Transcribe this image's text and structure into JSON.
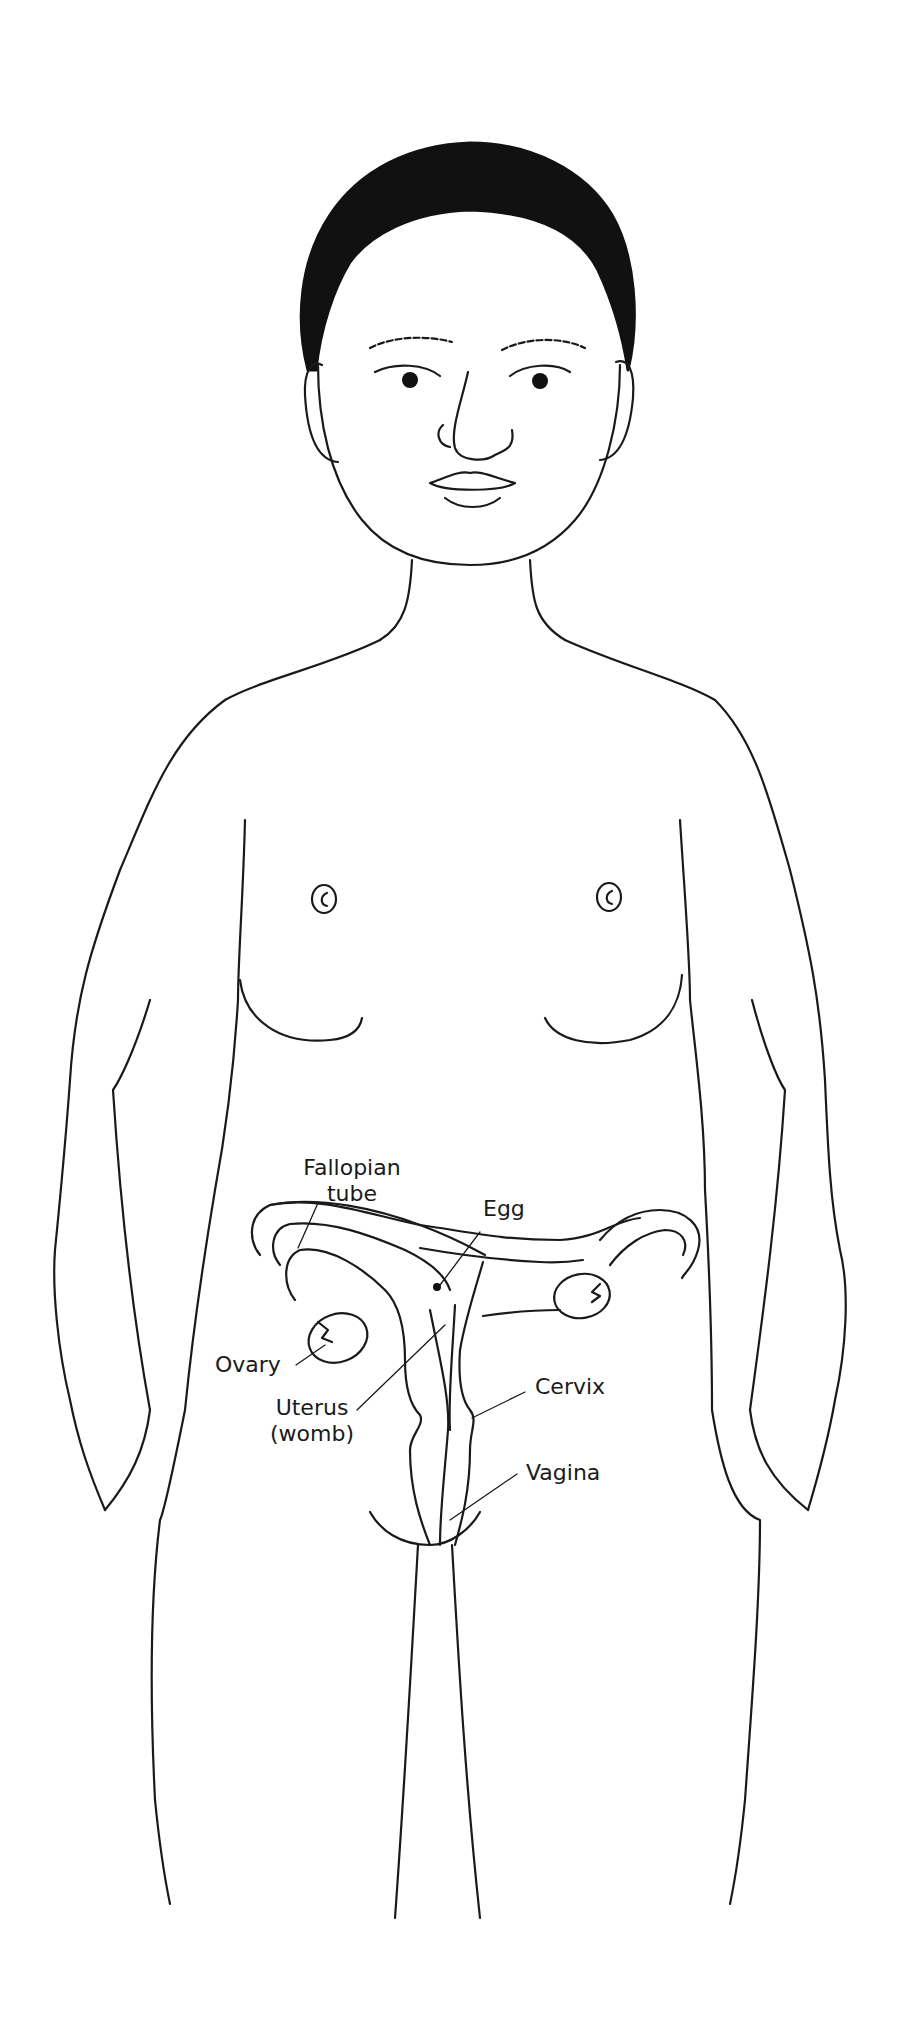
{
  "diagram": {
    "style": "black line drawing on white",
    "colors": {
      "line": "#1a1a1a",
      "hair": "#111111",
      "background": "#ffffff"
    }
  },
  "labels": {
    "fallopian_tube": "Fallopian\ntube",
    "egg": "Egg",
    "ovary": "Ovary",
    "uterus": "Uterus\n(womb)",
    "cervix": "Cervix",
    "vagina": "Vagina"
  }
}
